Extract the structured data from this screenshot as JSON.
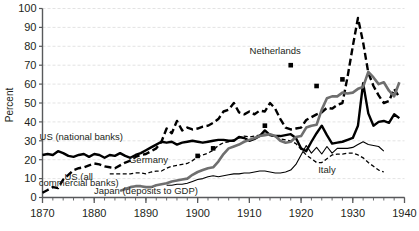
{
  "chart_data": {
    "type": "line",
    "title": "",
    "xlabel": "",
    "ylabel": "Percent",
    "xlim": [
      1870,
      1940
    ],
    "ylim": [
      0,
      100
    ],
    "xticks": [
      1870,
      1880,
      1890,
      1900,
      1910,
      1920,
      1930,
      1940
    ],
    "yticks": [
      0,
      10,
      20,
      30,
      40,
      50,
      60,
      70,
      80,
      90,
      100
    ],
    "xtick_labels": [
      "1870",
      "1880",
      "1890",
      "1900",
      "1910",
      "1920",
      "1930",
      "1940"
    ],
    "ytick_labels": [
      "0",
      "10",
      "20",
      "30",
      "40",
      "50",
      "60",
      "70",
      "80",
      "90",
      "100"
    ],
    "x_minor_tick_step": 2,
    "grid": "horizontal-dashed-light",
    "legend": "inline-labels",
    "colors": {
      "us_national": "#000000",
      "us_all_commercial": "#000000",
      "germany": "#000000",
      "japan": "#6f6f6f",
      "italy": "#000000",
      "netherlands": "#000000",
      "grid": "#dcdcdc",
      "axis": "#58595b",
      "text": "#231f20"
    },
    "series": [
      {
        "name": "US (national banks)",
        "style": "solid-thick",
        "color": "#000000",
        "label_x": 1877.5,
        "label_y": 30.5,
        "x": [
          1870,
          1871,
          1872,
          1873,
          1874,
          1875,
          1876,
          1877,
          1878,
          1879,
          1880,
          1881,
          1882,
          1883,
          1884,
          1885,
          1886,
          1887,
          1888,
          1889,
          1890,
          1891,
          1892,
          1893,
          1894,
          1895,
          1896,
          1897,
          1898,
          1899,
          1900,
          1901,
          1902,
          1903,
          1904,
          1905,
          1906,
          1907,
          1908,
          1909,
          1910,
          1911,
          1912,
          1913,
          1914,
          1915,
          1916,
          1917,
          1918,
          1919,
          1920,
          1921,
          1922,
          1923,
          1924,
          1925,
          1926,
          1927,
          1928,
          1929,
          1930,
          1931,
          1932,
          1933,
          1934,
          1935,
          1936,
          1937,
          1938,
          1939
        ],
        "y": [
          22.5,
          23.0,
          22.5,
          24.5,
          23.5,
          22.0,
          21.5,
          22.5,
          23.0,
          21.5,
          23.0,
          22.5,
          21.0,
          22.5,
          22.0,
          23.5,
          22.0,
          21.0,
          22.5,
          23.5,
          25.0,
          26.5,
          28.0,
          29.5,
          29.0,
          29.5,
          28.0,
          29.0,
          29.5,
          30.0,
          29.5,
          29.0,
          29.5,
          30.0,
          30.5,
          30.5,
          30.0,
          30.0,
          32.0,
          31.5,
          30.0,
          31.0,
          32.5,
          35.5,
          33.0,
          32.5,
          32.5,
          33.0,
          33.5,
          31.5,
          26.0,
          24.5,
          29.5,
          34.0,
          38.0,
          33.0,
          28.5,
          29.0,
          29.5,
          30.5,
          31.5,
          38.0,
          60.5,
          44.5,
          38.0,
          40.0,
          40.5,
          39.5,
          44.0,
          42.0
        ]
      },
      {
        "name": "US (all commercial banks)",
        "style": "dashed-thick",
        "color": "#000000",
        "label_x": 1877.0,
        "label_y": 9.0,
        "label_line2_y": 6.0,
        "x": [
          1870,
          1871,
          1872,
          1873,
          1874,
          1875,
          1876,
          1877,
          1878,
          1879,
          1880,
          1881,
          1882,
          1883,
          1884,
          1885,
          1886,
          1887,
          1888,
          1889,
          1890,
          1891,
          1892,
          1893,
          1894,
          1895,
          1896,
          1897,
          1898,
          1899,
          1900,
          1901,
          1902,
          1903,
          1904,
          1905,
          1906,
          1907,
          1908,
          1909,
          1910,
          1911,
          1912,
          1913,
          1914,
          1915,
          1916,
          1917,
          1918,
          1919,
          1920,
          1921,
          1922,
          1923,
          1924,
          1925,
          1926,
          1927,
          1928,
          1929,
          1930,
          1931,
          1932,
          1933,
          1934,
          1935,
          1936,
          1937,
          1938,
          1939
        ],
        "y": [
          2.5,
          4.0,
          5.5,
          5.0,
          9.5,
          12.0,
          14.5,
          15.5,
          16.0,
          17.0,
          18.0,
          17.5,
          16.5,
          16.0,
          15.5,
          17.0,
          18.5,
          19.5,
          21.5,
          22.5,
          23.0,
          24.5,
          26.0,
          29.5,
          36.5,
          34.0,
          40.5,
          35.5,
          37.0,
          36.0,
          36.5,
          37.5,
          38.0,
          39.5,
          41.5,
          45.5,
          46.5,
          50.0,
          45.0,
          44.0,
          45.5,
          44.0,
          46.0,
          45.5,
          50.0,
          47.0,
          41.5,
          37.0,
          36.0,
          36.5,
          37.0,
          41.0,
          42.5,
          44.0,
          45.0,
          47.5,
          47.0,
          49.0,
          50.0,
          64.0,
          80.0,
          95.0,
          82.0,
          66.0,
          59.0,
          54.0,
          50.0,
          51.0,
          57.5,
          53.0
        ]
      },
      {
        "name": "Germany",
        "style": "dashed-thin",
        "color": "#000000",
        "label_x": 1890.5,
        "label_y": 18.0,
        "x": [
          1883,
          1884,
          1885,
          1886,
          1887,
          1888,
          1889,
          1890,
          1891,
          1892,
          1893,
          1894,
          1895,
          1896,
          1897,
          1898,
          1899,
          1900,
          1901,
          1902,
          1903,
          1904,
          1905,
          1906,
          1907,
          1908,
          1909,
          1910,
          1911,
          1912,
          1913,
          1914,
          1915,
          1916,
          1917,
          1918,
          1919,
          1920,
          1921,
          1922,
          1923,
          1924,
          1925,
          1926,
          1927,
          1928,
          1929,
          1930,
          1931,
          1932,
          1933,
          1934,
          1935,
          1936
        ],
        "y": [
          12.5,
          12.5,
          12.5,
          12.5,
          12.5,
          13.0,
          13.0,
          12.5,
          13.5,
          14.0,
          14.0,
          15.5,
          16.5,
          17.0,
          17.5,
          18.0,
          19.5,
          21.5,
          22.5,
          23.5,
          25.0,
          27.5,
          29.0,
          29.5,
          30.5,
          31.5,
          32.5,
          32.0,
          32.5,
          33.0,
          33.5,
          33.0,
          32.0,
          31.0,
          30.5,
          30.0,
          28.5,
          25.5,
          22.5,
          20.5,
          18.5,
          18.5,
          20.5,
          22.5,
          23.0,
          23.0,
          23.5,
          23.5,
          22.5,
          21.0,
          18.5,
          16.5,
          14.5,
          13.5
        ]
      },
      {
        "name": "Japan (deposits to GDP)",
        "style": "solid-thick-gray",
        "color": "#6f6f6f",
        "label_x": 1890.0,
        "label_y": 2.0,
        "x": [
          1885,
          1886,
          1887,
          1888,
          1889,
          1890,
          1891,
          1892,
          1893,
          1894,
          1895,
          1896,
          1897,
          1898,
          1899,
          1900,
          1901,
          1902,
          1903,
          1904,
          1905,
          1906,
          1907,
          1908,
          1909,
          1910,
          1911,
          1912,
          1913,
          1914,
          1915,
          1916,
          1917,
          1918,
          1919,
          1920,
          1921,
          1922,
          1923,
          1924,
          1925,
          1926,
          1927,
          1928,
          1929,
          1930,
          1931,
          1932,
          1933,
          1934,
          1935,
          1936,
          1937,
          1938,
          1939
        ],
        "y": [
          3.5,
          4.5,
          5.5,
          6.0,
          6.0,
          5.5,
          5.5,
          6.5,
          7.0,
          7.5,
          8.5,
          9.0,
          9.5,
          10.0,
          12.0,
          13.5,
          14.5,
          15.5,
          16.0,
          19.0,
          23.0,
          26.0,
          27.0,
          28.0,
          29.5,
          30.5,
          31.5,
          32.5,
          33.0,
          33.5,
          32.5,
          30.0,
          29.0,
          29.5,
          32.0,
          32.5,
          37.0,
          38.0,
          38.5,
          46.5,
          52.5,
          53.5,
          53.5,
          55.5,
          55.0,
          55.5,
          57.5,
          58.5,
          66.5,
          63.5,
          60.0,
          61.0,
          56.5,
          53.5,
          61.0
        ]
      },
      {
        "name": "Italy",
        "style": "solid-thin",
        "color": "#000000",
        "label_x": 1925.0,
        "label_y": 13.0,
        "x": [
          1894,
          1895,
          1896,
          1897,
          1898,
          1899,
          1900,
          1901,
          1902,
          1903,
          1904,
          1905,
          1906,
          1907,
          1908,
          1909,
          1910,
          1911,
          1912,
          1913,
          1914,
          1915,
          1916,
          1917,
          1918,
          1919,
          1920,
          1921,
          1922,
          1923,
          1924,
          1925,
          1926,
          1927,
          1928,
          1929,
          1930,
          1931,
          1932,
          1933,
          1934,
          1935,
          1936
        ],
        "y": [
          6.5,
          6.5,
          7.0,
          7.0,
          7.5,
          8.5,
          9.5,
          10.0,
          11.0,
          11.5,
          11.0,
          11.5,
          12.0,
          12.5,
          12.5,
          13.0,
          13.0,
          13.5,
          14.0,
          14.0,
          13.5,
          13.0,
          13.0,
          13.5,
          14.5,
          17.5,
          22.5,
          27.5,
          23.5,
          26.5,
          23.0,
          27.0,
          23.5,
          26.0,
          26.0,
          26.0,
          26.5,
          28.0,
          29.5,
          28.0,
          27.5,
          27.0,
          24.5
        ]
      },
      {
        "name": "Netherlands",
        "style": "square-markers",
        "color": "#000000",
        "label_x": 1915.0,
        "label_y": 76.0,
        "x": [
          1900,
          1903,
          1913,
          1918,
          1923,
          1928
        ],
        "y": [
          22.0,
          26.0,
          38.0,
          70.0,
          59.0,
          62.5
        ]
      }
    ],
    "annotations": [
      {
        "name": "us-national-label",
        "text": "US (national banks)"
      },
      {
        "name": "us-all-commercial-label-line1",
        "text": "US (all"
      },
      {
        "name": "us-all-commercial-label-line2",
        "text": "commercial banks)"
      },
      {
        "name": "germany-label",
        "text": "Germany"
      },
      {
        "name": "japan-label",
        "text": "Japan (deposits to GDP)"
      },
      {
        "name": "italy-label",
        "text": "Italy"
      },
      {
        "name": "netherlands-label",
        "text": "Netherlands"
      }
    ]
  }
}
